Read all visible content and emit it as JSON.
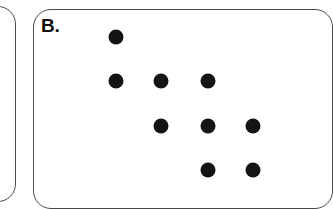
{
  "figure": {
    "background_color": "#ffffff",
    "width": 321,
    "height": 190,
    "outline_color": "#4a4a4a"
  },
  "panels": [
    {
      "id": "panel-a",
      "label": "",
      "partially_visible": true,
      "note": "left neighbouring panel, only its right rounded edge is in frame"
    },
    {
      "id": "panel-b",
      "label": "B.",
      "partially_visible": true,
      "note": "main panel, runs off the right and bottom of the frame"
    }
  ],
  "chart_data": {
    "type": "scatter",
    "title": "B.",
    "xlabel": "",
    "ylabel": "",
    "grid": false,
    "legend": null,
    "marker": {
      "shape": "circle",
      "color": "#141414",
      "diameter_px": 15
    },
    "columns": [
      1,
      2,
      3,
      4
    ],
    "rows": [
      1,
      2,
      3,
      4
    ],
    "column_x_px": [
      116,
      161,
      208,
      253
    ],
    "row_y_px": [
      37,
      81,
      126,
      170
    ],
    "pattern_description": "descending staircase of filled circles",
    "row_occupancy": [
      [
        1
      ],
      [
        1,
        2,
        3
      ],
      [
        2,
        3,
        4
      ],
      [
        3,
        4
      ]
    ],
    "points": [
      {
        "col": 1,
        "row": 1,
        "x": 116,
        "y": 37
      },
      {
        "col": 1,
        "row": 2,
        "x": 116,
        "y": 81
      },
      {
        "col": 2,
        "row": 2,
        "x": 161,
        "y": 81
      },
      {
        "col": 3,
        "row": 2,
        "x": 208,
        "y": 81
      },
      {
        "col": 2,
        "row": 3,
        "x": 161,
        "y": 126
      },
      {
        "col": 3,
        "row": 3,
        "x": 208,
        "y": 126
      },
      {
        "col": 4,
        "row": 3,
        "x": 253,
        "y": 126
      },
      {
        "col": 3,
        "row": 4,
        "x": 208,
        "y": 170
      },
      {
        "col": 4,
        "row": 4,
        "x": 253,
        "y": 170
      }
    ],
    "point_count": 9
  }
}
